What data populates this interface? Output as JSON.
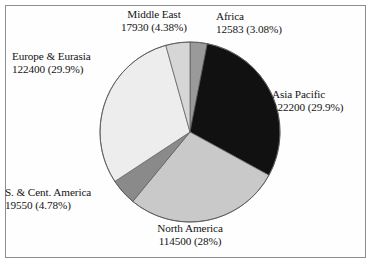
{
  "chart_data": {
    "type": "pie",
    "title": "",
    "subtitle": "",
    "xlabel": "",
    "ylabel": "",
    "legend_position": "none",
    "grid": false,
    "labels_outside": true,
    "total": 409163,
    "categories": [
      "Africa",
      "Asia Pacific",
      "North America",
      "S. & Cent. America",
      "Europe & Eurasia",
      "Middle East"
    ],
    "values": [
      12583,
      122200,
      114500,
      19550,
      122400,
      17930
    ],
    "percentages": [
      3.08,
      29.9,
      28,
      4.78,
      29.9,
      4.38
    ],
    "slices": [
      {
        "name": "Africa",
        "value": 12583,
        "value_text": "12583",
        "percent": 3.08,
        "percent_text": "(3.08%)",
        "label_line1": "Africa",
        "label_line2": "12583 (3.08%)",
        "color": "#9a9a9a",
        "start_angle": 0,
        "end_angle": 11.09
      },
      {
        "name": "Asia Pacific",
        "value": 122200,
        "value_text": "122200",
        "percent": 29.9,
        "percent_text": "(29.9%)",
        "label_line1": "Asia Pacific",
        "label_line2": "122200 (29.9%)",
        "color": "#111111",
        "start_angle": 11.09,
        "end_angle": 118.73
      },
      {
        "name": "North America",
        "value": 114500,
        "value_text": "114500",
        "percent": 28,
        "percent_text": "(28%)",
        "label_line1": "North America",
        "label_line2": "114500 (28%)",
        "color": "#c9c9c9",
        "start_angle": 118.73,
        "end_angle": 219.5
      },
      {
        "name": "S. & Cent. America",
        "value": 19550,
        "value_text": "19550",
        "percent": 4.78,
        "percent_text": "(4.78%)",
        "label_line1": "S. & Cent. America",
        "label_line2": "19550 (4.78%)",
        "color": "#8a8a8a",
        "start_angle": 219.5,
        "end_angle": 236.7
      },
      {
        "name": "Europe & Eurasia",
        "value": 122400,
        "value_text": "122400",
        "percent": 29.9,
        "percent_text": "(29.9%)",
        "label_line1": "Europe & Eurasia",
        "label_line2": "122400 (29.9%)",
        "color": "#ededed",
        "start_angle": 236.7,
        "end_angle": 344.4
      },
      {
        "name": "Middle East",
        "value": 17930,
        "value_text": "17930",
        "percent": 4.38,
        "percent_text": "(4.38%)",
        "label_line1": "Middle East",
        "label_line2": "17930 (4.38%)",
        "color": "#d6d6d6",
        "start_angle": 344.4,
        "end_angle": 360
      }
    ]
  },
  "geometry": {
    "center_x": 190,
    "center_y": 132,
    "radius": 90
  },
  "colors": {
    "frame": "#8d8d8d",
    "background": "#ffffff",
    "text": "#141414",
    "slice_outline": "#5a5a5a"
  }
}
